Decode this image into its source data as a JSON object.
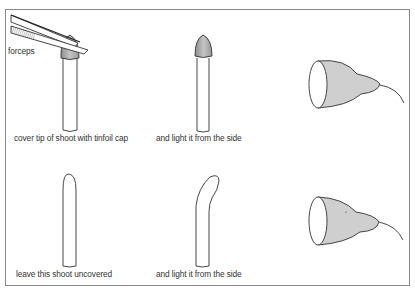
{
  "diagram": {
    "panels": [
      {
        "id": "covered-shoot",
        "caption": "cover tip of shoot with tinfoil cap",
        "tool_label": "forceps"
      },
      {
        "id": "covered-shoot-lit",
        "caption": "and light it from the side"
      },
      {
        "id": "uncovered-shoot",
        "caption": "leave this shoot uncovered"
      },
      {
        "id": "uncovered-shoot-lit",
        "caption": "and light it from the side"
      }
    ],
    "colors": {
      "outline": "#333333",
      "cap_fill": "#a8a8a8",
      "lamp_fill": "#cfcfcf",
      "frame": "#8a8a8a"
    }
  }
}
